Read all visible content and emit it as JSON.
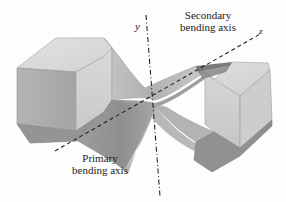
{
  "figure": {
    "background_color": "#ffffff",
    "width": 286,
    "height": 202
  },
  "labels": {
    "secondary_axis": "Secondary\nbending axis",
    "secondary_axis_line1": "Secondary",
    "secondary_axis_line2": "bending axis",
    "primary_axis": "Primary\nbending axis",
    "primary_axis_line1": "Primary",
    "primary_axis_line2": "bending axis",
    "y_axis": "y",
    "z_axis": "z"
  },
  "axes": [
    {
      "name": "y",
      "label": "y",
      "description": "Secondary bending axis",
      "style": "dash-dot",
      "orientation": "near-vertical",
      "from": [
        146,
        15
      ],
      "to": [
        160,
        196
      ],
      "color": "#1a1a1a"
    },
    {
      "name": "z",
      "label": "z",
      "description": "Primary bending axis",
      "style": "dashed",
      "orientation": "diagonal-rising-to-right",
      "from": [
        55,
        151
      ],
      "to": [
        262,
        33
      ],
      "color": "#1a1a1a"
    }
  ],
  "geometry": {
    "shape": "hourglass",
    "parts": [
      "left-block",
      "waist-neck",
      "right-block"
    ],
    "waist_center": [
      155,
      102
    ]
  },
  "colors": {
    "face_top_light": "#dcdcdc",
    "face_front_light": "#d2d2d2",
    "face_left_mid": "#adadad",
    "face_dark": "#909090",
    "face_darker": "#7e7e7e",
    "neck_mid": "#b9b9b9",
    "neck_shadow": "#9a9a9a",
    "groove_dark": "#6f6f6f",
    "outline": "#8a8a8a",
    "text": "#1a1a1a",
    "background": "#ffffff"
  }
}
